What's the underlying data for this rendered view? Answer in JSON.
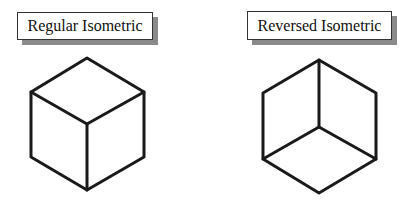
{
  "diagrams": [
    {
      "label": "Regular Isometric",
      "orientation": "regular"
    },
    {
      "label": "Reversed Isometric",
      "orientation": "reversed"
    }
  ],
  "colors": {
    "stroke": "#1a1a1a",
    "box_border": "#333333",
    "box_shadow": "#8a8a8a",
    "background": "#ffffff"
  }
}
